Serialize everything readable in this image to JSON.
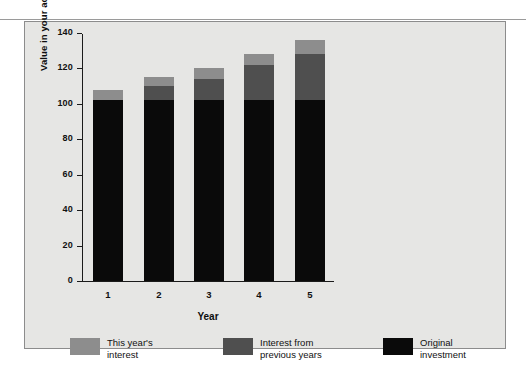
{
  "chart_data": {
    "type": "bar",
    "subtype": "stacked-vertical",
    "title": "",
    "xlabel": "Year",
    "ylabel": "Value in your account, dollars",
    "categories": [
      "1",
      "2",
      "3",
      "4",
      "5"
    ],
    "ylim": [
      0,
      140
    ],
    "yticks": [
      0,
      20,
      40,
      60,
      80,
      100,
      120,
      140
    ],
    "ytick_labels": [
      "0",
      "20",
      "40",
      "60",
      "80",
      "100",
      "120",
      "140"
    ],
    "grid": false,
    "legend_position": "bottom",
    "series": [
      {
        "name": "Original investment",
        "color": "#0a0a0a",
        "values": [
          102,
          102,
          102,
          102,
          102
        ]
      },
      {
        "name": "Interest from previous years",
        "color": "#4f4f4f",
        "values": [
          0,
          8,
          12,
          20,
          26
        ]
      },
      {
        "name": "This year's interest",
        "color": "#8d8d8d",
        "values": [
          6,
          5,
          6,
          6,
          8
        ]
      }
    ],
    "totals": [
      108,
      115,
      120,
      128,
      136
    ],
    "stack_order_bottom_to_top": [
      "Original investment",
      "Interest from previous years",
      "This year's interest"
    ]
  },
  "legend": {
    "items": [
      {
        "label": "This year's\ninterest",
        "color": "#8d8d8d",
        "swatch_name": "this-years-interest"
      },
      {
        "label": "Interest from\nprevious years",
        "color": "#4f4f4f",
        "swatch_name": "interest-previous-years"
      },
      {
        "label": "Original\ninvestment",
        "color": "#0a0a0a",
        "swatch_name": "original-investment"
      }
    ]
  },
  "colors": {
    "panel_background": "#e6e6e4",
    "panel_border": "#8c8c8c",
    "axis": "#1b1b1b",
    "text": "#111111",
    "page_background": "#ffffff"
  }
}
